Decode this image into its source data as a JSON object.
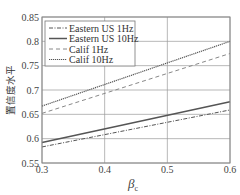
{
  "chart_data": {
    "type": "line",
    "title": "",
    "xlabel": "β_c",
    "xlabel_main": "β",
    "xlabel_sub": "c",
    "ylabel": "置信度水平",
    "xlim": [
      0.3,
      0.6
    ],
    "ylim": [
      0.55,
      0.85
    ],
    "x_ticks": [
      "0.3",
      "0.4",
      "0.5",
      "0.6"
    ],
    "y_ticks": [
      "0.55",
      "0.6",
      "0.65",
      "0.7",
      "0.75",
      "0.8",
      "0.85"
    ],
    "grid": true,
    "legend_position": "upper left",
    "x": [
      0.3,
      0.6
    ],
    "series": [
      {
        "name": "Eastern US 1Hz",
        "style": "dash-dot",
        "values": [
          0.583,
          0.659
        ]
      },
      {
        "name": "Eastern US 10Hz",
        "style": "solid",
        "values": [
          0.592,
          0.676
        ]
      },
      {
        "name": "Calif 1Hz",
        "style": "dashed",
        "values": [
          0.652,
          0.775
        ]
      },
      {
        "name": "Calif 10Hz",
        "style": "dotted",
        "values": [
          0.667,
          0.8
        ]
      }
    ]
  }
}
